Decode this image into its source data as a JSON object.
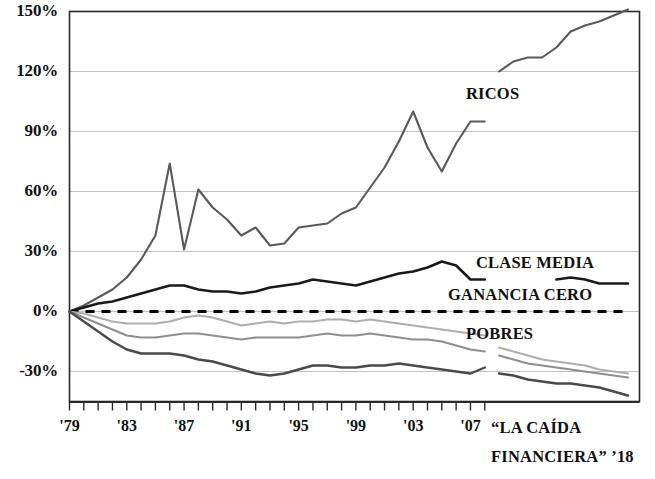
{
  "chart_data": {
    "type": "line",
    "title": "",
    "subtitle": "",
    "xlabel": "",
    "ylabel": "",
    "xlim": [
      1979,
      2018
    ],
    "ylim": [
      -45,
      150
    ],
    "grid": true,
    "grid_axis": "y",
    "legend": "inline-annotations",
    "y_ticks": [
      "150%",
      "120%",
      "90%",
      "60%",
      "30%",
      "0%",
      "-30%"
    ],
    "y_tick_values": [
      150,
      120,
      90,
      60,
      30,
      0,
      -30
    ],
    "x_ticks": [
      "'79",
      "'83",
      "'87",
      "'91",
      "'95",
      "'99",
      "'03",
      "'07"
    ],
    "x_tick_values": [
      1979,
      1983,
      1987,
      1991,
      1995,
      1999,
      2003,
      2007
    ],
    "x_minor_tick_values": [
      1979,
      1980,
      1981,
      1982,
      1983,
      1984,
      1985,
      1986,
      1987,
      1988,
      1989,
      1990,
      1991,
      1992,
      1993,
      1994,
      1995,
      1996,
      1997,
      1998,
      1999,
      2000,
      2001,
      2002,
      2003,
      2004,
      2005,
      2006,
      2007,
      2008
    ],
    "caption": {
      "line1": "“LA CAÍDA",
      "line2": "FINANCIERA” ’18"
    },
    "annotations": [
      {
        "name": "ricos-label",
        "text": "RICOS",
        "x_px": 466,
        "y_px": 95
      },
      {
        "name": "clase-media-label",
        "text": "CLASE MEDIA",
        "x_px": 476,
        "y_px": 264
      },
      {
        "name": "ganancia-cero-label",
        "text": "GANANCIA CERO",
        "x_px": 448,
        "y_px": 296
      },
      {
        "name": "pobres-label",
        "text": "POBRES",
        "x_px": 466,
        "y_px": 335
      }
    ],
    "colors": {
      "ricos": "#5a5a5a",
      "clase_media": "#1a1a1a",
      "ganancia_cero": "#000000",
      "grupo_medio_bajo": "#a8a8a8",
      "grupo_bajo": "#8a8a8a",
      "pobres": "#4a4a4a",
      "gridline": "#b9b9b9",
      "axis": "#2a2a2a",
      "background": "#ffffff"
    },
    "series": [
      {
        "name": "RICOS",
        "label": "RICOS",
        "color": "#5a5a5a",
        "style": "solid",
        "width": 2.1,
        "segments": [
          {
            "x": [
              1979,
              1980,
              1981,
              1982,
              1983,
              1984,
              1985,
              1986,
              1987,
              1988,
              1989,
              1990,
              1991,
              1992,
              1993,
              1994,
              1995,
              1996,
              1997,
              1998,
              1999,
              2000,
              2001,
              2002,
              2003,
              2004,
              2005,
              2006,
              2007,
              2008
            ],
            "y": [
              0,
              3,
              7,
              11,
              17,
              26,
              38,
              74,
              31,
              61,
              52,
              46,
              38,
              42,
              33,
              34,
              42,
              43,
              44,
              49,
              52,
              62,
              72,
              85,
              100,
              82,
              70,
              84,
              95,
              95
            ]
          },
          {
            "x": [
              2009,
              2010,
              2011,
              2012,
              2013,
              2014,
              2015,
              2016,
              2017,
              2018
            ],
            "y": [
              120,
              125,
              127,
              127,
              132,
              140,
              143,
              145,
              148,
              151
            ]
          }
        ]
      },
      {
        "name": "CLASE MEDIA",
        "label": "CLASE MEDIA",
        "color": "#1a1a1a",
        "style": "solid",
        "width": 2.6,
        "segments": [
          {
            "x": [
              1979,
              1980,
              1981,
              1982,
              1983,
              1984,
              1985,
              1986,
              1987,
              1988,
              1989,
              1990,
              1991,
              1992,
              1993,
              1994,
              1995,
              1996,
              1997,
              1998,
              1999,
              2000,
              2001,
              2002,
              2003,
              2004,
              2005,
              2006,
              2007,
              2008
            ],
            "y": [
              0,
              2,
              4,
              5,
              7,
              9,
              11,
              13,
              13,
              11,
              10,
              10,
              9,
              10,
              12,
              13,
              14,
              16,
              15,
              14,
              13,
              15,
              17,
              19,
              20,
              22,
              25,
              23,
              16,
              16
            ]
          },
          {
            "x": [
              2013,
              2014,
              2015,
              2016,
              2017,
              2018
            ],
            "y": [
              16,
              17,
              16,
              14,
              14,
              14
            ]
          }
        ]
      },
      {
        "name": "GANANCIA CERO",
        "label": "GANANCIA CERO",
        "color": "#000000",
        "style": "dashed",
        "width": 3.0,
        "segments": [
          {
            "x": [
              1979,
              2018
            ],
            "y": [
              0,
              0
            ]
          }
        ]
      },
      {
        "name": "grupo-medio-bajo",
        "label": "",
        "color": "#aeaeae",
        "style": "solid",
        "width": 2.1,
        "segments": [
          {
            "x": [
              1979,
              1980,
              1981,
              1982,
              1983,
              1984,
              1985,
              1986,
              1987,
              1988,
              1989,
              1990,
              1991,
              1992,
              1993,
              1994,
              1995,
              1996,
              1997,
              1998,
              1999,
              2000,
              2001,
              2002,
              2003,
              2004,
              2005,
              2006,
              2007,
              2008
            ],
            "y": [
              0,
              -1,
              -3,
              -5,
              -6,
              -6,
              -6,
              -5,
              -3,
              -2,
              -3,
              -5,
              -7,
              -6,
              -5,
              -6,
              -5,
              -5,
              -4,
              -4,
              -5,
              -4,
              -5,
              -6,
              -7,
              -8,
              -9,
              -10,
              -11,
              -12
            ]
          },
          {
            "x": [
              2009,
              2010,
              2011,
              2012,
              2013,
              2014,
              2015,
              2016,
              2017,
              2018
            ],
            "y": [
              -18,
              -20,
              -22,
              -24,
              -25,
              -26,
              -27,
              -29,
              -30,
              -31
            ]
          }
        ]
      },
      {
        "name": "grupo-bajo",
        "label": "",
        "color": "#8e8e8e",
        "style": "solid",
        "width": 2.1,
        "segments": [
          {
            "x": [
              1979,
              1980,
              1981,
              1982,
              1983,
              1984,
              1985,
              1986,
              1987,
              1988,
              1989,
              1990,
              1991,
              1992,
              1993,
              1994,
              1995,
              1996,
              1997,
              1998,
              1999,
              2000,
              2001,
              2002,
              2003,
              2004,
              2005,
              2006,
              2007,
              2008
            ],
            "y": [
              0,
              -3,
              -6,
              -9,
              -12,
              -13,
              -13,
              -12,
              -11,
              -11,
              -12,
              -13,
              -14,
              -13,
              -13,
              -13,
              -13,
              -12,
              -11,
              -12,
              -12,
              -11,
              -12,
              -13,
              -14,
              -14,
              -15,
              -17,
              -19,
              -20
            ]
          },
          {
            "x": [
              2009,
              2010,
              2011,
              2012,
              2013,
              2014,
              2015,
              2016,
              2017,
              2018
            ],
            "y": [
              -22,
              -24,
              -26,
              -27,
              -28,
              -29,
              -30,
              -31,
              -32,
              -33
            ]
          }
        ]
      },
      {
        "name": "POBRES",
        "label": "POBRES",
        "color": "#4a4a4a",
        "style": "solid",
        "width": 2.4,
        "segments": [
          {
            "x": [
              1979,
              1980,
              1981,
              1982,
              1983,
              1984,
              1985,
              1986,
              1987,
              1988,
              1989,
              1990,
              1991,
              1992,
              1993,
              1994,
              1995,
              1996,
              1997,
              1998,
              1999,
              2000,
              2001,
              2002,
              2003,
              2004,
              2005,
              2006,
              2007,
              2008
            ],
            "y": [
              0,
              -5,
              -10,
              -15,
              -19,
              -21,
              -21,
              -21,
              -22,
              -24,
              -25,
              -27,
              -29,
              -31,
              -32,
              -31,
              -29,
              -27,
              -27,
              -28,
              -28,
              -27,
              -27,
              -26,
              -27,
              -28,
              -29,
              -30,
              -31,
              -28
            ]
          },
          {
            "x": [
              2009,
              2010,
              2011,
              2012,
              2013,
              2014,
              2015,
              2016,
              2017,
              2018
            ],
            "y": [
              -31,
              -32,
              -34,
              -35,
              -36,
              -36,
              -37,
              -38,
              -40,
              -42
            ]
          }
        ]
      }
    ]
  }
}
